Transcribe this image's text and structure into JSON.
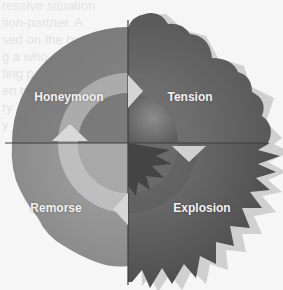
{
  "diagram": {
    "type": "cycle",
    "title": "",
    "stages": [
      {
        "id": "honeymoon",
        "label": "Honeymoon",
        "quadrant": "top-left",
        "order": 1
      },
      {
        "id": "tension",
        "label": "Tension",
        "quadrant": "top-right",
        "order": 2
      },
      {
        "id": "explosion",
        "label": "Explosion",
        "quadrant": "bottom-right",
        "order": 3
      },
      {
        "id": "remorse",
        "label": "Remorse",
        "quadrant": "bottom-left",
        "order": 4
      }
    ],
    "flow_direction": "clockwise",
    "colors": {
      "honeymoon": "#8a8a8a",
      "tension": "#6a6a6a",
      "explosion": "#555555",
      "remorse": "#8f8f8f",
      "ring": "#b5b5b5",
      "arrow": "#d0d0d0"
    }
  },
  "background_text": {
    "faded_lines": [
      "ressive situation",
      "tion-partner. A",
      "sed on the basis",
      "g a who are",
      "ting partner",
      "en been",
      "ry",
      "y"
    ]
  }
}
